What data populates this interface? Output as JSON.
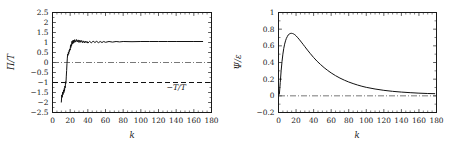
{
  "figure": {
    "background": "#ffffff",
    "foreground": "#1a1a1a",
    "panel_count": 2
  },
  "chart_data": [
    {
      "id": "left-panel",
      "type": "line",
      "title": "",
      "xlabel": "k",
      "ylabel": "Π/T",
      "xlim": [
        0,
        180
      ],
      "ylim": [
        -2.5,
        2.5
      ],
      "grid": false,
      "legend_position": "none",
      "xticks": [
        0,
        20,
        40,
        60,
        80,
        100,
        120,
        140,
        160,
        180
      ],
      "xticklabels": [
        "0",
        "20",
        "40",
        "60",
        "80",
        "100",
        "120",
        "140",
        "160",
        "180"
      ],
      "yticks": [
        2.5,
        2,
        1.5,
        1,
        0.5,
        0,
        -0.5,
        -1,
        -1.5,
        -2,
        -2.5
      ],
      "yticklabels": [
        "2.5",
        "2",
        "1.5",
        "1",
        "0.5",
        "0",
        "−0.5",
        "−1",
        "−1.5",
        "−2",
        "−2.5"
      ],
      "annotations": [
        {
          "text": "−T/T",
          "x": 140,
          "y": -1.38
        }
      ],
      "reference_lines": [
        {
          "name": "zero-line",
          "style": "dash-dot",
          "y": 0,
          "color": "#555555"
        },
        {
          "name": "minus-T-over-T-line",
          "style": "dashed",
          "y": -1,
          "color": "#111111"
        }
      ],
      "series": [
        {
          "name": "Pi over T",
          "style": "solid",
          "color": "#111111",
          "x": [
            10,
            10.5,
            11,
            11.5,
            12,
            12.5,
            13,
            13.3,
            13.6,
            14,
            14.4,
            14.8,
            15.2,
            15.6,
            16,
            16.4,
            16.8,
            17.2,
            17.6,
            18,
            18.4,
            18.8,
            19.2,
            19.6,
            20,
            20.4,
            20.8,
            21.2,
            21.6,
            22,
            22.5,
            23,
            23.5,
            24,
            24.5,
            25,
            26,
            27,
            28,
            29,
            30,
            31,
            32,
            33,
            34,
            35,
            36,
            37,
            38,
            39,
            40,
            42,
            44,
            46,
            48,
            50,
            52,
            54,
            56,
            58,
            60,
            64,
            68,
            72,
            76,
            80,
            90,
            100,
            110,
            120,
            130,
            140,
            150,
            160,
            170
          ],
          "y": [
            -1.98,
            -1.62,
            -1.74,
            -1.48,
            -1.6,
            -1.38,
            -1.5,
            -1.3,
            -1.42,
            -1.18,
            -1.26,
            -0.96,
            -1.04,
            -0.72,
            -0.4,
            -0.05,
            0.22,
            0.42,
            0.36,
            0.52,
            0.44,
            0.6,
            0.55,
            0.68,
            0.62,
            0.86,
            0.75,
            0.92,
            0.84,
            1.06,
            0.92,
            1.1,
            0.96,
            1.12,
            1.0,
            1.14,
            1.02,
            1.15,
            1.03,
            1.13,
            1.0,
            1.12,
            1.01,
            1.1,
            0.99,
            1.08,
            0.98,
            1.07,
            0.99,
            1.06,
            0.97,
            1.06,
            0.98,
            1.07,
            1.0,
            1.06,
            0.99,
            1.05,
            1.0,
            1.05,
            1.01,
            1.05,
            1.02,
            1.05,
            1.03,
            1.05,
            1.04,
            1.05,
            1.05,
            1.05,
            1.05,
            1.05,
            1.05,
            1.05,
            1.05
          ]
        }
      ]
    },
    {
      "id": "right-panel",
      "type": "line",
      "title": "",
      "xlabel": "k",
      "ylabel": "Ψ/ε",
      "xlim": [
        0,
        180
      ],
      "ylim": [
        -0.2,
        1
      ],
      "grid": false,
      "legend_position": "none",
      "xticks": [
        0,
        20,
        40,
        60,
        80,
        100,
        120,
        140,
        160,
        180
      ],
      "xticklabels": [
        "0",
        "20",
        "40",
        "60",
        "80",
        "100",
        "120",
        "140",
        "160",
        "180"
      ],
      "yticks": [
        1,
        0.8,
        0.6,
        0.4,
        0.2,
        0,
        -0.2
      ],
      "yticklabels": [
        "1",
        "0.8",
        "0.6",
        "0.4",
        "0.2",
        "0",
        "−0.2"
      ],
      "annotations": [],
      "reference_lines": [
        {
          "name": "zero-line",
          "style": "dash-dot",
          "y": 0,
          "color": "#555555"
        }
      ],
      "series": [
        {
          "name": "Psi over epsilon",
          "style": "solid",
          "color": "#111111",
          "x": [
            1,
            2,
            3,
            4,
            5,
            6,
            7,
            8,
            9,
            10,
            11,
            12,
            13,
            14,
            15,
            16,
            17,
            18,
            19,
            20,
            22,
            24,
            26,
            28,
            30,
            33,
            36,
            40,
            44,
            48,
            52,
            56,
            60,
            65,
            70,
            75,
            80,
            85,
            90,
            95,
            100,
            110,
            120,
            130,
            140,
            150,
            160,
            170,
            178
          ],
          "y": [
            0.02,
            0.16,
            0.3,
            0.41,
            0.5,
            0.57,
            0.62,
            0.66,
            0.69,
            0.71,
            0.73,
            0.74,
            0.745,
            0.75,
            0.75,
            0.748,
            0.744,
            0.738,
            0.73,
            0.72,
            0.697,
            0.672,
            0.645,
            0.618,
            0.59,
            0.549,
            0.51,
            0.46,
            0.415,
            0.375,
            0.338,
            0.305,
            0.275,
            0.242,
            0.213,
            0.188,
            0.166,
            0.147,
            0.13,
            0.115,
            0.102,
            0.082,
            0.066,
            0.054,
            0.045,
            0.038,
            0.032,
            0.028,
            0.026
          ]
        }
      ]
    }
  ]
}
